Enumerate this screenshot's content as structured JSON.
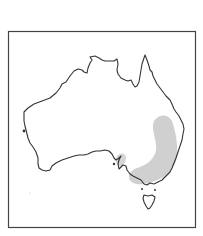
{
  "map": {
    "subject": "Australia distribution map",
    "colors": {
      "background": "#ffffff",
      "frame": "#444444",
      "coastline": "#333333",
      "range_fill": "#d0d0d0"
    },
    "regions": [
      {
        "name": "Australian mainland",
        "type": "landmass"
      },
      {
        "name": "Tasmania",
        "type": "landmass"
      },
      {
        "name": "South-eastern Australia",
        "type": "distribution-range"
      }
    ]
  }
}
